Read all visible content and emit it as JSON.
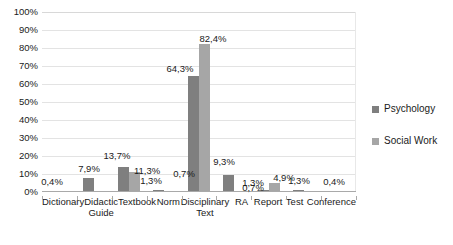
{
  "chart_data": {
    "type": "bar",
    "title": "",
    "subtitle": "",
    "xlabel": "",
    "ylabel": "",
    "ylim": [
      0,
      100
    ],
    "grid": true,
    "legend_position": "right",
    "categories": [
      "Dictionary",
      "Didactic Guide",
      "Textbook",
      "Norm",
      "Disciplinary Text",
      "RA",
      "Report",
      "Test",
      "Conference"
    ],
    "category_lines": [
      [
        "Dictionary"
      ],
      [
        "Didactic",
        "Guide"
      ],
      [
        "Textbook"
      ],
      [
        "Norm"
      ],
      [
        "Disciplinary",
        "Text"
      ],
      [
        "RA"
      ],
      [
        "Report"
      ],
      [
        "Test"
      ],
      [
        "Conference"
      ]
    ],
    "ytick_labels": [
      "100%",
      "90%",
      "80%",
      "70%",
      "60%",
      "50%",
      "40%",
      "30%",
      "20%",
      "10%",
      "0%"
    ],
    "ytick_values": [
      100,
      90,
      80,
      70,
      60,
      50,
      40,
      30,
      20,
      10,
      0
    ],
    "series": [
      {
        "name": "Psychology",
        "color": "#7f7f7f",
        "values": [
          0.4,
          7.9,
          13.7,
          1.3,
          64.3,
          9.3,
          1.3,
          1.3,
          0.4
        ],
        "labels": [
          "0,4%",
          "7,9%",
          "13,7%",
          "1,3%",
          "64,3%",
          "9,3%",
          "1,3%",
          "1,3%",
          "0,4%"
        ]
      },
      {
        "name": "Social Work",
        "color": "#a6a6a6",
        "values": [
          0.0,
          0.0,
          11.3,
          0.7,
          82.4,
          0.7,
          4.9,
          0.0,
          0.0
        ],
        "labels": [
          "",
          "",
          "11,3%",
          "0,7%",
          "82,4%",
          "0,7%",
          "4,9%",
          "",
          ""
        ]
      }
    ]
  },
  "legend": {
    "items": [
      {
        "label": "Psychology",
        "color": "#7f7f7f"
      },
      {
        "label": "Social Work",
        "color": "#a6a6a6"
      }
    ]
  }
}
